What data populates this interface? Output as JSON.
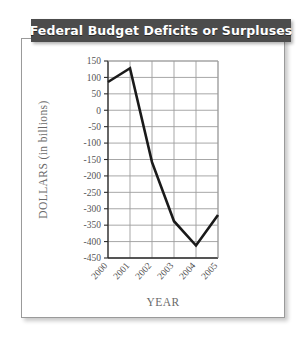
{
  "title": {
    "text": "Federal Budget Deficits or Surpluses"
  },
  "colors": {
    "title_bar_bg": "#4c4c4c",
    "title_text": "#ffffff",
    "card_bg": "#ffffff",
    "card_border": "#9a9a9a",
    "grid": "#9d9d9d",
    "axis": "#2b2b2b",
    "series_line": "#1a1a1a",
    "label_text": "#555555",
    "axis_title_text": "#6a6a6a"
  },
  "chart_data": {
    "type": "line",
    "title": "Federal Budget Deficits or Surpluses",
    "xlabel": "YEAR",
    "ylabel": "DOLLARS (in billions)",
    "categories": [
      "2000",
      "2001",
      "2002",
      "2003",
      "2004",
      "2005"
    ],
    "values": [
      86,
      128,
      -158,
      -338,
      -412,
      -319
    ],
    "series": [
      {
        "name": "Federal Budget Deficit or Surplus",
        "values": [
          86,
          128,
          -158,
          -338,
          -412,
          -319
        ]
      }
    ],
    "ylim": [
      -450,
      150
    ],
    "ytick_step": 50,
    "yticks": [
      150,
      100,
      50,
      0,
      -50,
      -100,
      -150,
      -200,
      -250,
      -300,
      -350,
      -400,
      -450
    ],
    "ytick_labels": [
      "150",
      "100",
      "50",
      "0",
      "-50",
      "-100",
      "-150",
      "-200",
      "-250",
      "-300",
      "-350",
      "-400",
      "-450"
    ],
    "xtick_labels": [
      "2000",
      "2001",
      "2002",
      "2003",
      "2004",
      "2005"
    ],
    "xtick_rotation": -48,
    "grid": true,
    "grid_horizontal": true,
    "grid_vertical": true,
    "legend": false,
    "legend_position": "none",
    "marker": "none",
    "line_width": 2.6
  }
}
